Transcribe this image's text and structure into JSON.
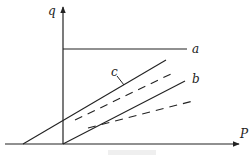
{
  "diagram": {
    "axes": {
      "x_label": "P",
      "y_label": "q"
    },
    "lines": [
      {
        "id": "a",
        "label": "a",
        "style": "solid",
        "kind": "horizontal"
      },
      {
        "id": "c",
        "label": "c",
        "style": "solid",
        "kind": "sloped-upper"
      },
      {
        "id": "c-dashed",
        "label": "",
        "style": "dashed",
        "kind": "sloped-upper-dashed"
      },
      {
        "id": "b",
        "label": "b",
        "style": "solid",
        "kind": "sloped-lower"
      },
      {
        "id": "b-dashed",
        "label": "",
        "style": "dashed",
        "kind": "sloped-lower-dashed"
      }
    ],
    "caption": "",
    "stroke_color": "#222222"
  }
}
